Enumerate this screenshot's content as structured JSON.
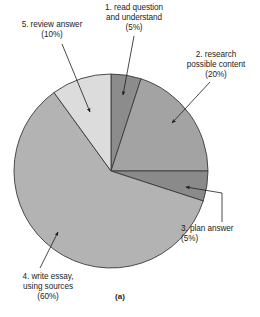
{
  "figure": {
    "caption": "(a)",
    "background": "#ffffff"
  },
  "chart_data": {
    "type": "pie",
    "title": "",
    "xlabel": "",
    "ylabel": "",
    "legend_position": "none",
    "grid": false,
    "start_angle_deg": 0,
    "direction": "clockwise",
    "center": {
      "x": 111,
      "y": 171,
      "radius": 97
    },
    "categories": [
      "1. read question and understand",
      "2. research possible content",
      "3. plan answer",
      "4. write essay, using sources",
      "5. review answer"
    ],
    "values": [
      5,
      20,
      5,
      60,
      10
    ],
    "unit": "%",
    "colors": [
      "#8c8c8c",
      "#a3a3a3",
      "#8a8a8a",
      "#b3b3b3",
      "#dcdcdc"
    ],
    "stroke": "#3a3a3a",
    "slices": [
      {
        "id": "slice-1",
        "name": "read-question",
        "label": "1. read question\nand understand\n(5%)",
        "value": 5,
        "color": "#8c8c8c",
        "leader_label_anchor": {
          "x": 134,
          "y": 36
        },
        "arrow_tip": {
          "x": 123,
          "y": 95
        }
      },
      {
        "id": "slice-2",
        "name": "research-possible-content",
        "label": "2. research\npossible content\n(20%)",
        "value": 20,
        "color": "#a3a3a3",
        "leader_label_anchor": {
          "x": 210,
          "y": 82
        },
        "arrow_tip": {
          "x": 172,
          "y": 123
        }
      },
      {
        "id": "slice-3",
        "name": "plan-answer",
        "label": "3. plan answer\n(5%)",
        "value": 5,
        "color": "#8a8a8a",
        "leader_label_anchor": {
          "x": 222,
          "y": 222
        },
        "arrow_tip": {
          "x": 186,
          "y": 187
        }
      },
      {
        "id": "slice-4",
        "name": "write-essay-using-sources",
        "label": "4. write essay,\nusing sources\n(60%)",
        "value": 60,
        "color": "#b3b3b3",
        "leader_label_anchor": {
          "x": 40,
          "y": 268
        },
        "arrow_tip": {
          "x": 58,
          "y": 232
        }
      },
      {
        "id": "slice-5",
        "name": "review-answer",
        "label": "5. review answer\n(10%)",
        "value": 10,
        "color": "#dcdcdc",
        "leader_label_anchor": {
          "x": 62,
          "y": 44
        },
        "arrow_tip": {
          "x": 90,
          "y": 112
        }
      }
    ]
  }
}
